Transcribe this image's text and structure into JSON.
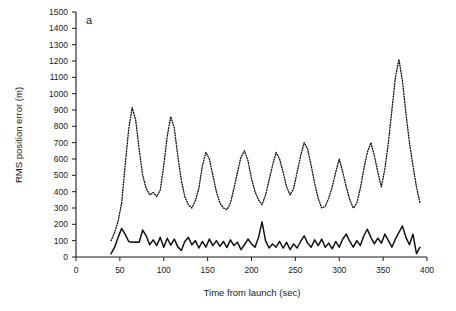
{
  "chart_data": {
    "type": "line",
    "title": "",
    "panel_label": "a",
    "xlabel": "Time from launch (sec)",
    "ylabel": "RMS position error (m)",
    "xlim": [
      0,
      400
    ],
    "ylim": [
      0,
      1500
    ],
    "xticks": [
      0,
      50,
      100,
      150,
      200,
      250,
      300,
      350,
      400
    ],
    "xtick_labels": [
      "0",
      "50",
      "100",
      "150",
      "200",
      "250",
      "300",
      "350",
      "400"
    ],
    "yticks": [
      0,
      100,
      200,
      300,
      400,
      500,
      600,
      700,
      800,
      900,
      1000,
      1100,
      1200,
      1300,
      1400,
      1500
    ],
    "ytick_labels": [
      "0",
      "100",
      "200",
      "300",
      "400",
      "500",
      "600",
      "700",
      "800",
      "900",
      "1000",
      "1100",
      "1200",
      "1300",
      "1400",
      "1500"
    ],
    "grid": false,
    "legend": "none",
    "series": [
      {
        "name": "dotted-series",
        "style": "dotted",
        "color": "#111111",
        "x": [
          40,
          44,
          48,
          52,
          56,
          60,
          64,
          68,
          72,
          76,
          80,
          84,
          88,
          92,
          96,
          100,
          104,
          108,
          112,
          116,
          120,
          124,
          128,
          132,
          136,
          140,
          144,
          148,
          152,
          156,
          160,
          164,
          168,
          172,
          176,
          180,
          184,
          188,
          192,
          196,
          200,
          204,
          208,
          212,
          216,
          220,
          224,
          228,
          232,
          236,
          240,
          244,
          248,
          252,
          256,
          260,
          264,
          268,
          272,
          276,
          280,
          284,
          288,
          292,
          296,
          300,
          304,
          308,
          312,
          316,
          320,
          324,
          328,
          332,
          336,
          340,
          344,
          348,
          352,
          356,
          360,
          364,
          368,
          372,
          376,
          380,
          384,
          388,
          392
        ],
        "y": [
          100,
          150,
          220,
          330,
          560,
          780,
          915,
          840,
          660,
          500,
          420,
          380,
          395,
          370,
          410,
          560,
          740,
          860,
          790,
          620,
          470,
          370,
          320,
          300,
          345,
          420,
          560,
          640,
          600,
          500,
          400,
          330,
          300,
          290,
          330,
          420,
          520,
          610,
          650,
          590,
          480,
          400,
          350,
          320,
          380,
          470,
          560,
          640,
          600,
          520,
          430,
          380,
          420,
          520,
          620,
          700,
          660,
          560,
          450,
          360,
          300,
          310,
          360,
          430,
          520,
          600,
          520,
          430,
          350,
          300,
          330,
          420,
          540,
          640,
          700,
          620,
          520,
          430,
          540,
          700,
          900,
          1100,
          1210,
          1080,
          880,
          700,
          560,
          430,
          330
        ]
      },
      {
        "name": "solid-series",
        "style": "solid",
        "color": "#111111",
        "x": [
          40,
          44,
          48,
          52,
          56,
          60,
          64,
          68,
          72,
          76,
          80,
          84,
          88,
          92,
          96,
          100,
          104,
          108,
          112,
          116,
          120,
          124,
          128,
          132,
          136,
          140,
          144,
          148,
          152,
          156,
          160,
          164,
          168,
          172,
          176,
          180,
          184,
          188,
          192,
          196,
          200,
          204,
          208,
          212,
          216,
          220,
          224,
          228,
          232,
          236,
          240,
          244,
          248,
          252,
          256,
          260,
          264,
          268,
          272,
          276,
          280,
          284,
          288,
          292,
          296,
          300,
          304,
          308,
          312,
          316,
          320,
          324,
          328,
          332,
          336,
          340,
          344,
          348,
          352,
          356,
          360,
          364,
          368,
          372,
          376,
          380,
          384,
          388,
          392
        ],
        "y": [
          20,
          60,
          120,
          175,
          140,
          95,
          90,
          92,
          90,
          165,
          130,
          75,
          105,
          70,
          120,
          60,
          115,
          72,
          110,
          62,
          40,
          95,
          120,
          75,
          100,
          55,
          95,
          60,
          110,
          70,
          100,
          65,
          95,
          58,
          105,
          70,
          90,
          45,
          75,
          110,
          80,
          60,
          120,
          215,
          100,
          55,
          80,
          60,
          95,
          55,
          90,
          45,
          80,
          55,
          95,
          130,
          85,
          60,
          105,
          70,
          110,
          60,
          85,
          50,
          95,
          60,
          110,
          140,
          95,
          60,
          100,
          70,
          130,
          170,
          120,
          80,
          115,
          85,
          140,
          100,
          60,
          110,
          150,
          190,
          120,
          75,
          140,
          20,
          60
        ]
      }
    ]
  }
}
